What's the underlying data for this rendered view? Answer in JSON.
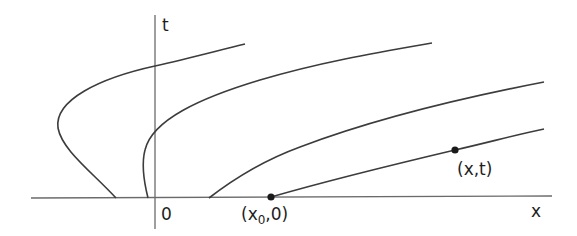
{
  "diagram": {
    "type": "characteristic-curves",
    "colors": {
      "background": "#ffffff",
      "axis": "#6a6a6a",
      "curve": "#3c3c3c",
      "point": "#1a1a1a",
      "text": "#1e1e1e"
    },
    "axes": {
      "x_label": "x",
      "t_label": "t",
      "origin_label": "0"
    },
    "points": [
      {
        "id": "x0",
        "label_main": "(x",
        "label_sub": "0",
        "label_tail": ",0)"
      },
      {
        "id": "xt",
        "label": "(x,t)"
      }
    ],
    "curves": [
      {
        "id": "curve-1",
        "description": "backward-bending characteristic starting left of origin"
      },
      {
        "id": "curve-2",
        "description": "characteristic starting just left of origin"
      },
      {
        "id": "curve-3",
        "description": "characteristic starting right of origin"
      },
      {
        "id": "curve-4",
        "description": "characteristic through (x0,0) and (x,t)"
      }
    ]
  }
}
